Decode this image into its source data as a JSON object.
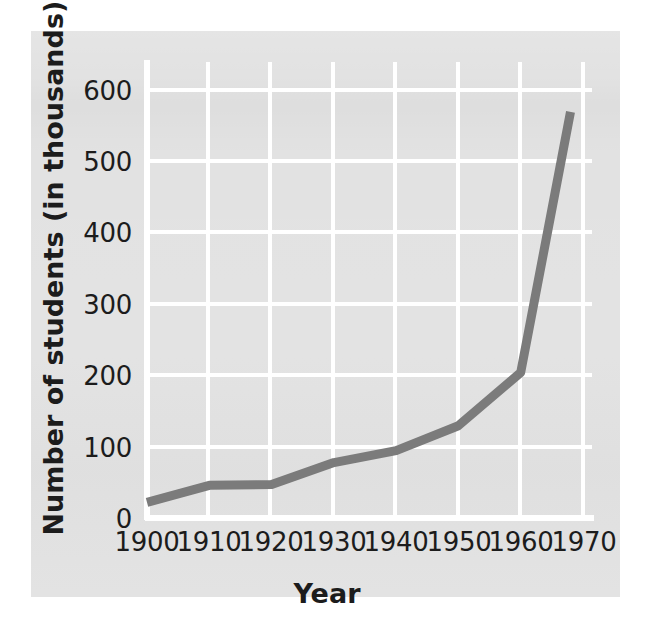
{
  "figure": {
    "background_color": "#ffffff",
    "panel_color": "#e2e2e2",
    "gridline_color": "#ffffff",
    "axis_color": "#ffffff",
    "line_color": "#7b7b7b",
    "text_color": "#1c1c1c"
  },
  "chart_data": {
    "type": "line",
    "title": "",
    "xlabel": "Year",
    "ylabel": "Number of students (in thousands)",
    "xlim": [
      1900,
      1970
    ],
    "ylim": [
      0,
      600
    ],
    "xticks": [
      1900,
      1910,
      1920,
      1930,
      1940,
      1950,
      1960,
      1970
    ],
    "xtick_labels": [
      "1900",
      "1910",
      "1920",
      "1930",
      "1940",
      "1950",
      "1960",
      "1970"
    ],
    "yticks": [
      0,
      100,
      200,
      300,
      400,
      500,
      600
    ],
    "ytick_labels": [
      "0",
      "100",
      "200",
      "300",
      "400",
      "500",
      "600"
    ],
    "grid": true,
    "legend": false,
    "series": [
      {
        "name": "Number of students (in thousands)",
        "x": [
          1900,
          1910,
          1920,
          1930,
          1940,
          1950,
          1960,
          1968
        ],
        "values": [
          22,
          46,
          47,
          78,
          95,
          130,
          205,
          572
        ]
      }
    ]
  }
}
